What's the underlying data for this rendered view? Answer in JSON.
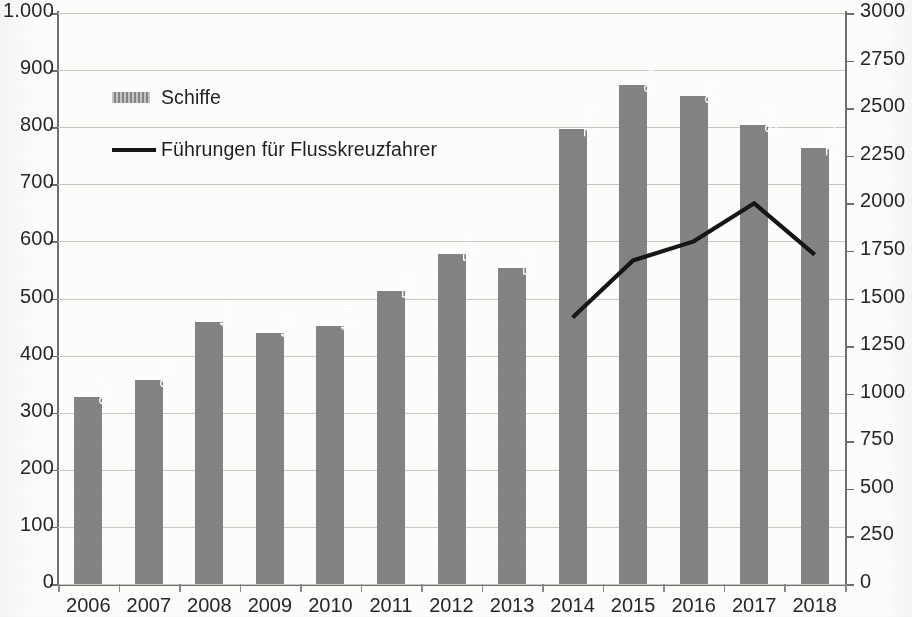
{
  "chart_data": {
    "type": "bar",
    "title": "",
    "subtitle": "",
    "xlabel": "",
    "ylabel": "",
    "y2label": "",
    "grid": true,
    "legend_position": "inside-top-left",
    "categories": [
      "2006",
      "2007",
      "2008",
      "2009",
      "2010",
      "2011",
      "2012",
      "2013",
      "2014",
      "2015",
      "2016",
      "2017",
      "2018"
    ],
    "left_axis": {
      "min": 0,
      "max": 1000,
      "step": 100,
      "tick_labels": [
        "0",
        "100",
        "200",
        "300",
        "400",
        "500",
        "600",
        "700",
        "800",
        "900",
        "1.000"
      ]
    },
    "right_axis": {
      "min": 0,
      "max": 3000,
      "step": 250,
      "tick_labels": [
        "0",
        "250",
        "500",
        "750",
        "1000",
        "1250",
        "1500",
        "1750",
        "2000",
        "2250",
        "2500",
        "2750",
        "3000"
      ]
    },
    "series": [
      {
        "name": "Schiffe",
        "type": "bar",
        "axis": "left",
        "color": "#838383",
        "label_color": "#ffffff",
        "values": [
          327,
          358,
          458,
          439,
          451,
          514,
          578,
          553,
          796,
          874,
          855,
          804,
          764
        ],
        "data_labels": [
          "327",
          "358",
          "458",
          "439",
          "451",
          "514",
          "578",
          "553",
          "796",
          "874",
          "855",
          "804",
          "764"
        ]
      },
      {
        "name": "Führungen für Flusskreuzfahrer",
        "type": "line",
        "axis": "right",
        "color": "#161616",
        "values": [
          null,
          null,
          null,
          null,
          null,
          null,
          null,
          null,
          1400,
          1700,
          1800,
          2000,
          1730
        ]
      }
    ]
  },
  "legend": {
    "items": [
      {
        "label": "Schiffe",
        "marker": "bar-swatch"
      },
      {
        "label": "Führungen für Flusskreuzfahrer",
        "marker": "line-swatch"
      }
    ]
  }
}
